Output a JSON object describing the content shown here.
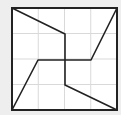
{
  "diagram": {
    "background": "#eeeeee",
    "grid_color": "#d9d9d9",
    "line_color": "#222222",
    "square": {
      "x": 12,
      "y": 8,
      "width": 105,
      "height": 102
    },
    "grid": {
      "cols": 4,
      "rows": 4
    },
    "polylines": [
      {
        "name": "path-a",
        "points": [
          [
            12,
            8
          ],
          [
            65,
            34
          ],
          [
            65,
            85
          ],
          [
            117,
            110
          ]
        ]
      },
      {
        "name": "path-b",
        "points": [
          [
            12,
            110
          ],
          [
            38,
            60
          ],
          [
            91,
            60
          ],
          [
            117,
            8
          ]
        ]
      }
    ]
  }
}
